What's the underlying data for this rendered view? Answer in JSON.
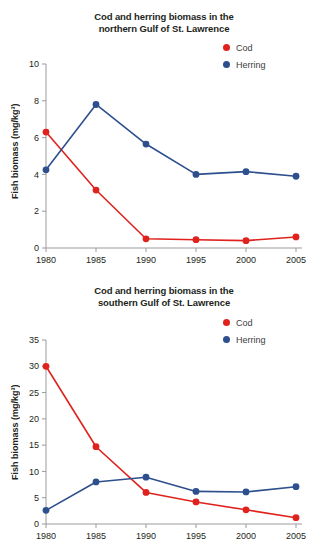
{
  "page": {
    "background_color": "#ffffff",
    "colors": {
      "cod": "#e0221e",
      "herring": "#2d4f8e",
      "axis": "#9b9b9b",
      "text": "#231f20"
    }
  },
  "chart_data": [
    {
      "id": "north",
      "type": "line",
      "title": "Cod and herring biomass in the northern Gulf of St. Lawrence",
      "title_line1": "Cod and herring biomass in the",
      "title_line2": "northern Gulf of St. Lawrence",
      "xlabel": "",
      "ylabel": "Fish biomass (mg/kg³)",
      "x": [
        1980,
        1985,
        1990,
        1995,
        2000,
        2005
      ],
      "categories": [
        "1980",
        "1985",
        "1990",
        "1995",
        "2000",
        "2005"
      ],
      "xlim": [
        1980,
        2005
      ],
      "ylim": [
        0,
        10
      ],
      "yticks": [
        0,
        2,
        4,
        6,
        8,
        10
      ],
      "ytick_labels": [
        "0",
        "2",
        "4",
        "6",
        "8",
        "10"
      ],
      "grid": false,
      "legend_position": "top-right",
      "series": [
        {
          "name": "Cod",
          "color": "#e0221e",
          "values": [
            6.3,
            3.15,
            0.5,
            0.45,
            0.4,
            0.6
          ]
        },
        {
          "name": "Herring",
          "color": "#2d4f8e",
          "values": [
            4.25,
            7.8,
            5.65,
            4.0,
            4.15,
            3.9
          ]
        }
      ]
    },
    {
      "id": "south",
      "type": "line",
      "title": "Cod and herring biomass in the southern Gulf of St. Lawrence",
      "title_line1": "Cod and herring biomass in the",
      "title_line2": "southern Gulf of St. Lawrence",
      "xlabel": "",
      "ylabel": "Fish biomass (mg/kg³)",
      "x": [
        1980,
        1985,
        1990,
        1995,
        2000,
        2005
      ],
      "categories": [
        "1980",
        "1985",
        "1990",
        "1995",
        "2000",
        "2005"
      ],
      "xlim": [
        1980,
        2005
      ],
      "ylim": [
        0,
        35
      ],
      "yticks": [
        0,
        5,
        10,
        15,
        20,
        25,
        30,
        35
      ],
      "ytick_labels": [
        "0",
        "5",
        "10",
        "15",
        "20",
        "25",
        "30",
        "35"
      ],
      "grid": false,
      "legend_position": "top-right",
      "series": [
        {
          "name": "Cod",
          "color": "#e0221e",
          "values": [
            30.0,
            14.7,
            6.0,
            4.2,
            2.7,
            1.2
          ]
        },
        {
          "name": "Herring",
          "color": "#2d4f8e",
          "values": [
            2.6,
            8.0,
            8.9,
            6.2,
            6.1,
            7.1
          ]
        }
      ]
    }
  ]
}
